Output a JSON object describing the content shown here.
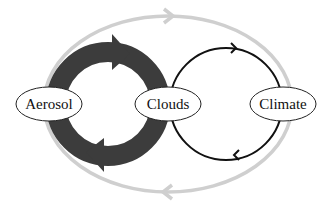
{
  "diagram": {
    "nodes": [
      {
        "id": "aerosol",
        "label": "Aerosol"
      },
      {
        "id": "clouds",
        "label": "Clouds"
      },
      {
        "id": "climate",
        "label": "Climate"
      }
    ],
    "loops": [
      {
        "id": "aerosol-clouds",
        "style": "thick dark gray",
        "direction": "clockwise"
      },
      {
        "id": "clouds-climate",
        "style": "thin black",
        "direction": "clockwise"
      },
      {
        "id": "outer",
        "style": "light gray",
        "direction": "clockwise",
        "spans": "aerosol-climate"
      }
    ],
    "colors": {
      "outer_loop": "#cfcfcf",
      "aerosol_clouds_loop": "#3c3c3c",
      "clouds_climate_loop": "#111111",
      "node_fill": "#ffffff",
      "node_stroke": "#222222"
    }
  }
}
